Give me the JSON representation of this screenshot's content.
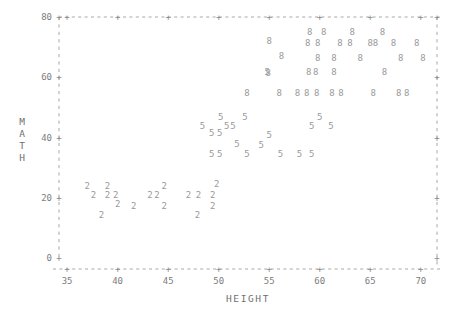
{
  "chart_data": {
    "type": "scatter",
    "title": "",
    "xlabel": "HEIGHT",
    "ylabel": "MATH",
    "xlim": [
      34.2,
      71.6
    ],
    "ylim": [
      0,
      80
    ],
    "xticks": [
      35,
      40,
      45,
      50,
      55,
      60,
      65,
      70
    ],
    "yticks": [
      0,
      20,
      40,
      60,
      80
    ],
    "grid": false,
    "legend": "none",
    "marker_style": "group-digit",
    "note": "Marker glyph encodes the group code (2, 5, 8); plotted as text characters.",
    "series": [
      {
        "name": "2",
        "marker": "2",
        "points": [
          [
            37.0,
            24.0
          ],
          [
            37.6,
            21.0
          ],
          [
            39.0,
            24.0
          ],
          [
            39.0,
            21.0
          ],
          [
            39.8,
            21.0
          ],
          [
            40.0,
            18.0
          ],
          [
            38.4,
            14.5
          ],
          [
            41.6,
            17.5
          ],
          [
            43.2,
            21.0
          ],
          [
            43.9,
            21.0
          ],
          [
            44.6,
            24.0
          ],
          [
            44.6,
            17.5
          ],
          [
            47.0,
            21.0
          ],
          [
            48.0,
            21.0
          ],
          [
            49.4,
            21.0
          ],
          [
            49.4,
            17.5
          ],
          [
            49.8,
            24.5
          ],
          [
            47.9,
            14.5
          ]
        ]
      },
      {
        "name": "5",
        "marker": "5",
        "points": [
          [
            48.4,
            44.0
          ],
          [
            50.2,
            47.0
          ],
          [
            49.3,
            41.5
          ],
          [
            50.1,
            41.5
          ],
          [
            50.8,
            44.0
          ],
          [
            51.4,
            44.0
          ],
          [
            52.6,
            47.0
          ],
          [
            51.8,
            38.0
          ],
          [
            49.3,
            34.5
          ],
          [
            50.1,
            34.5
          ],
          [
            52.8,
            34.5
          ],
          [
            55.0,
            41.0
          ],
          [
            54.2,
            37.5
          ],
          [
            56.1,
            34.5
          ],
          [
            58.0,
            34.5
          ],
          [
            59.2,
            34.5
          ],
          [
            60.0,
            47.0
          ],
          [
            59.2,
            44.0
          ],
          [
            61.1,
            44.0
          ],
          [
            54.8,
            62.0
          ]
        ]
      },
      {
        "name": "8",
        "marker": "8",
        "points": [
          [
            55.0,
            72.0
          ],
          [
            56.2,
            67.0
          ],
          [
            54.9,
            61.5
          ],
          [
            59.0,
            75.0
          ],
          [
            60.4,
            75.0
          ],
          [
            58.8,
            71.5
          ],
          [
            59.8,
            71.5
          ],
          [
            59.8,
            66.5
          ],
          [
            58.9,
            62.0
          ],
          [
            59.6,
            62.0
          ],
          [
            58.7,
            55.0
          ],
          [
            59.7,
            55.0
          ],
          [
            63.2,
            75.0
          ],
          [
            62.0,
            71.5
          ],
          [
            63.0,
            71.5
          ],
          [
            65.0,
            71.5
          ],
          [
            61.4,
            62.0
          ],
          [
            62.1,
            55.0
          ],
          [
            56.0,
            55.0
          ],
          [
            57.8,
            55.0
          ],
          [
            61.4,
            66.5
          ],
          [
            64.0,
            66.5
          ],
          [
            66.2,
            75.0
          ],
          [
            65.5,
            71.5
          ],
          [
            67.3,
            71.5
          ],
          [
            68.0,
            66.5
          ],
          [
            66.4,
            62.0
          ],
          [
            65.3,
            55.0
          ],
          [
            67.8,
            55.0
          ],
          [
            68.6,
            55.0
          ],
          [
            69.6,
            71.5
          ],
          [
            70.2,
            66.5
          ],
          [
            52.8,
            55.0
          ],
          [
            61.2,
            55.0
          ]
        ]
      }
    ]
  },
  "axes": {
    "y_axis_title_chars": [
      "M",
      "A",
      "T",
      "H"
    ],
    "x_axis_title": "HEIGHT",
    "y_tick_labels": [
      "80",
      "60",
      "40",
      "20",
      "0"
    ],
    "x_tick_labels": [
      "35",
      "40",
      "45",
      "50",
      "55",
      "60",
      "65",
      "70"
    ],
    "tick_glyph": "+"
  },
  "colors": {
    "background": "#ffffff",
    "text": "#8a8a8a",
    "marker": "#9a9a9a",
    "frame": "#9e9e9e"
  }
}
